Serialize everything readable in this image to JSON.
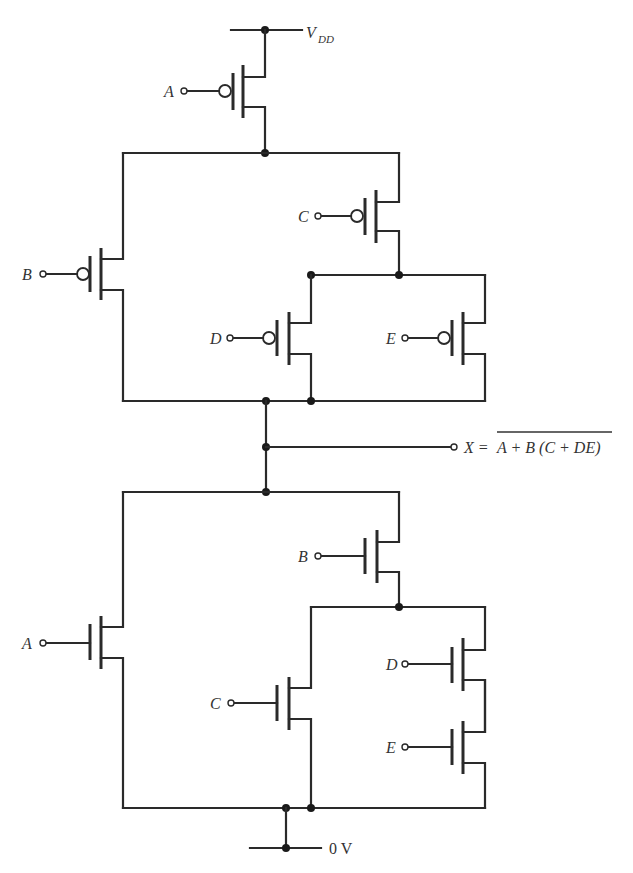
{
  "diagram": {
    "supply": {
      "label": "V",
      "subscript": "DD"
    },
    "ground": {
      "label": "0 V"
    },
    "output": {
      "lhs": "X =",
      "expression": "A + B (C + DE)",
      "overbar": true
    },
    "pull_up_network": {
      "type": "PMOS",
      "transistors": [
        {
          "gate": "A"
        },
        {
          "gate": "B"
        },
        {
          "gate": "C"
        },
        {
          "gate": "D"
        },
        {
          "gate": "E"
        }
      ]
    },
    "pull_down_network": {
      "type": "NMOS",
      "transistors": [
        {
          "gate": "B"
        },
        {
          "gate": "A"
        },
        {
          "gate": "D"
        },
        {
          "gate": "C"
        },
        {
          "gate": "E"
        }
      ]
    },
    "colors": {
      "line": "#2a2a2a",
      "background": "#ffffff"
    }
  }
}
